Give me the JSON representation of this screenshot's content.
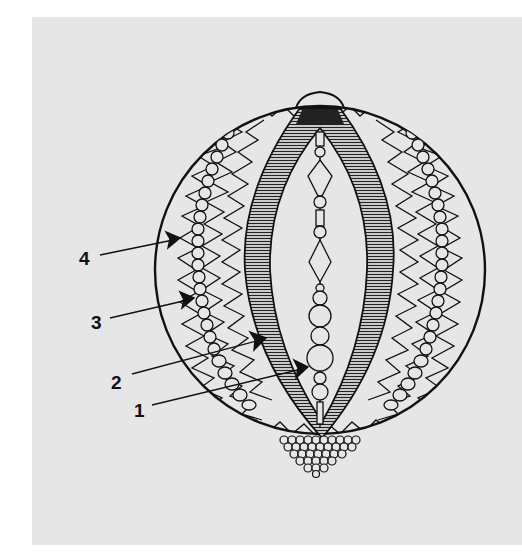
{
  "figure": {
    "background_color": "#e6e6e6",
    "ink_color": "#111111"
  },
  "callouts": [
    {
      "label": "1",
      "target": "central bead string"
    },
    {
      "label": "2",
      "target": "hatched vertical band"
    },
    {
      "label": "3",
      "target": "column of round beads"
    },
    {
      "label": "4",
      "target": "zig-zag border"
    }
  ]
}
